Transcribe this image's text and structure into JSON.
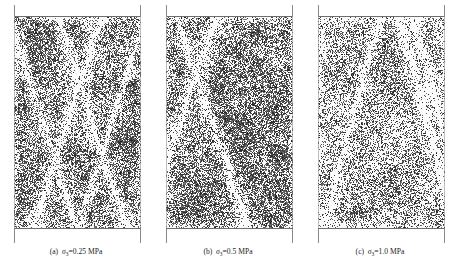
{
  "figure": {
    "background_color": "#ffffff",
    "frame_color": "#6d6d6d",
    "text_color": "#1c1c1c",
    "panel_count": 3
  },
  "panels": [
    {
      "id": "panel-a",
      "label": "(a)",
      "symbol": "σ",
      "subscript": "3",
      "equals": "=",
      "value": "0.25",
      "unit": "MPa",
      "caption": "(a) σ3=0.25 MPa",
      "specimen": {
        "description": "speckled rock specimen with conjugate X-shaped white shear bands",
        "texture_density": 0.62,
        "dominant_band_angle_deg": 62,
        "band_count": 4,
        "seed": 11
      }
    },
    {
      "id": "panel-b",
      "label": "(b)",
      "symbol": "σ",
      "subscript": "3",
      "equals": "=",
      "value": "0.5",
      "unit": "MPa",
      "caption": "(b) σ3=0.5 MPa",
      "specimen": {
        "description": "speckled rock specimen with one dominant diagonal white shear band",
        "texture_density": 0.64,
        "dominant_band_angle_deg": 60,
        "band_count": 2,
        "seed": 27
      }
    },
    {
      "id": "panel-c",
      "label": "(c)",
      "symbol": "σ",
      "subscript": "3",
      "equals": "=",
      "value": "1.0",
      "unit": "MPa",
      "caption": "(c) σ3=1.0 MPa",
      "specimen": {
        "description": "speckled rock specimen with diffuse lighter texture and broad white zones",
        "texture_density": 0.44,
        "dominant_band_angle_deg": 66,
        "band_count": 3,
        "seed": 43
      }
    }
  ]
}
